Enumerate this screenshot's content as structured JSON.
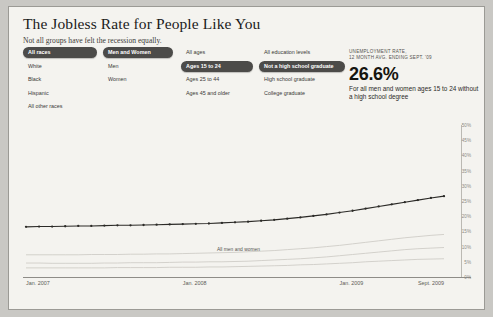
{
  "title": "The Jobless Rate for People Like You",
  "subtitle": "Not all groups have felt the recession equally.",
  "filters": {
    "race": {
      "name": "race-filter",
      "items": [
        {
          "label": "All races",
          "selected": true
        },
        {
          "label": "White",
          "selected": false
        },
        {
          "label": "Black",
          "selected": false
        },
        {
          "label": "Hispanic",
          "selected": false
        },
        {
          "label": "All other races",
          "selected": false
        }
      ]
    },
    "gender": {
      "name": "gender-filter",
      "items": [
        {
          "label": "Men and Women",
          "selected": true
        },
        {
          "label": "Men",
          "selected": false
        },
        {
          "label": "Women",
          "selected": false
        }
      ]
    },
    "age": {
      "name": "age-filter",
      "items": [
        {
          "label": "All ages",
          "selected": false
        },
        {
          "label": "Ages 15 to 24",
          "selected": true
        },
        {
          "label": "Ages 25 to 44",
          "selected": false
        },
        {
          "label": "Ages 45 and older",
          "selected": false
        }
      ]
    },
    "education": {
      "name": "education-filter",
      "items": [
        {
          "label": "All education levels",
          "selected": false
        },
        {
          "label": "Not a high school graduate",
          "selected": true
        },
        {
          "label": "High school graduate",
          "selected": false
        },
        {
          "label": "College graduate",
          "selected": false
        }
      ]
    }
  },
  "stat": {
    "kicker_line1": "UNEMPLOYMENT RATE,",
    "kicker_line2": "12 MONTH AVG. ENDING SEPT. '09",
    "value": "26.6%",
    "description": "For all men and women ages 15 to 24 without a high school degree"
  },
  "chevron": "›",
  "colors": {
    "panel_bg": "#f4f3ef",
    "page_bg": "#c9c8c4",
    "selected_pill": "#4c4b49",
    "selected_text": "#ffffff",
    "line": "#2b2a27",
    "faint_series": "#cfcdc7",
    "axis": "#8e8c87",
    "tick_text": "#8d8b85"
  },
  "chart_data": {
    "type": "line",
    "title": "",
    "xlabel": "",
    "ylabel": "",
    "ylim": [
      0,
      50
    ],
    "grid": false,
    "legend_position": "inline-annotation",
    "ytick_labels": [
      "50%",
      "45%",
      "40%",
      "35%",
      "30%",
      "25%",
      "20%",
      "15%",
      "10%",
      "5%",
      "0%"
    ],
    "ytick_values": [
      50,
      45,
      40,
      35,
      30,
      25,
      20,
      15,
      10,
      5,
      0
    ],
    "xtick_labels": [
      "Jan. 2007",
      "Jan. 2008",
      "Jan. 2009",
      "Sept. 2009"
    ],
    "xtick_positions": [
      0,
      12,
      24,
      32
    ],
    "annotation": "All men and women",
    "x": [
      0,
      1,
      2,
      3,
      4,
      5,
      6,
      7,
      8,
      9,
      10,
      11,
      12,
      13,
      14,
      15,
      16,
      17,
      18,
      19,
      20,
      21,
      22,
      23,
      24,
      25,
      26,
      27,
      28,
      29,
      30,
      31,
      32
    ],
    "series": [
      {
        "name": "Selected group: all races, men and women, ages 15 to 24, not a high school graduate",
        "highlight": true,
        "values": [
          16.5,
          16.6,
          16.6,
          16.7,
          16.8,
          16.8,
          16.9,
          17.0,
          17.0,
          17.1,
          17.2,
          17.3,
          17.4,
          17.5,
          17.6,
          17.8,
          18.0,
          18.2,
          18.5,
          18.8,
          19.2,
          19.6,
          20.1,
          20.6,
          21.2,
          21.8,
          22.5,
          23.2,
          23.9,
          24.6,
          25.3,
          26.0,
          26.6
        ]
      },
      {
        "name": "All men and women",
        "highlight": false,
        "values": [
          4.6,
          4.6,
          4.5,
          4.5,
          4.5,
          4.5,
          4.6,
          4.6,
          4.7,
          4.7,
          4.7,
          4.8,
          4.9,
          4.9,
          5.0,
          5.0,
          5.1,
          5.2,
          5.4,
          5.6,
          5.8,
          6.0,
          6.3,
          6.6,
          7.0,
          7.4,
          7.8,
          8.2,
          8.6,
          9.0,
          9.3,
          9.5,
          9.7
        ]
      },
      {
        "name": "Other group trend (background)",
        "highlight": false,
        "values": [
          7.3,
          7.3,
          7.3,
          7.3,
          7.3,
          7.4,
          7.4,
          7.4,
          7.5,
          7.5,
          7.6,
          7.6,
          7.7,
          7.8,
          7.9,
          8.0,
          8.1,
          8.3,
          8.5,
          8.7,
          9.0,
          9.3,
          9.6,
          10.0,
          10.4,
          10.9,
          11.4,
          11.9,
          12.4,
          12.9,
          13.3,
          13.7,
          14.0
        ]
      },
      {
        "name": "Other group trend (background low)",
        "highlight": false,
        "values": [
          3.0,
          3.0,
          3.0,
          3.0,
          3.0,
          3.0,
          3.0,
          3.1,
          3.1,
          3.1,
          3.1,
          3.2,
          3.2,
          3.2,
          3.3,
          3.3,
          3.4,
          3.5,
          3.6,
          3.7,
          3.8,
          4.0,
          4.1,
          4.3,
          4.5,
          4.7,
          5.0,
          5.2,
          5.4,
          5.6,
          5.8,
          5.9,
          6.0
        ]
      }
    ]
  }
}
